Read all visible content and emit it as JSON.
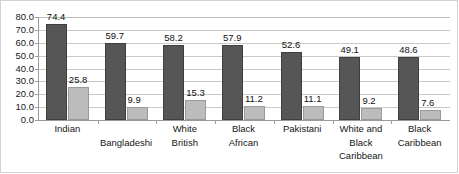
{
  "chart_data": {
    "type": "bar",
    "title": "",
    "subtitle": "",
    "xlabel": "",
    "ylabel": "",
    "ylim": [
      0,
      80
    ],
    "ytick_step": 10,
    "grid": true,
    "legend": "none",
    "label_format": "one-decimal",
    "categories": [
      "Indian",
      "Bangladeshi",
      "White British",
      "Black African",
      "Pakistani",
      "White and Black Caribbean",
      "Black Caribbean"
    ],
    "category_lines": [
      [
        "Indian"
      ],
      [
        "Bangladeshi"
      ],
      [
        "White",
        "British"
      ],
      [
        "Black",
        "African"
      ],
      [
        "Pakistani"
      ],
      [
        "White and",
        "Black",
        "Caribbean"
      ],
      [
        "Black",
        "Caribbean"
      ]
    ],
    "category_label_offset_lines": [
      0,
      1,
      0,
      0,
      0,
      0,
      0
    ],
    "ytick_labels": [
      "80.0",
      "70.0",
      "60.0",
      "50.0",
      "40.0",
      "30.0",
      "20.0",
      "10.0",
      "0.0"
    ],
    "ytick_values": [
      80,
      70,
      60,
      50,
      40,
      30,
      20,
      10,
      0
    ],
    "series": [
      {
        "name": "series-1",
        "color": "#565656",
        "values": [
          74.4,
          59.7,
          58.2,
          57.9,
          52.6,
          49.1,
          48.6
        ],
        "labels": [
          "74.4",
          "59.7",
          "58.2",
          "57.9",
          "52.6",
          "49.1",
          "48.6"
        ]
      },
      {
        "name": "series-2",
        "color": "#bcbcbc",
        "values": [
          25.8,
          9.9,
          15.3,
          11.2,
          11.1,
          9.2,
          7.6
        ],
        "labels": [
          "25.8",
          "9.9",
          "15.3",
          "11.2",
          "11.1",
          "9.2",
          "7.6"
        ]
      }
    ]
  },
  "colors": {
    "primary_bar": "#565656",
    "secondary_bar": "#bcbcbc",
    "gridline": "#c9c9c9",
    "axis": "#9b9b9b",
    "text": "#161616",
    "background": "#ffffff"
  }
}
